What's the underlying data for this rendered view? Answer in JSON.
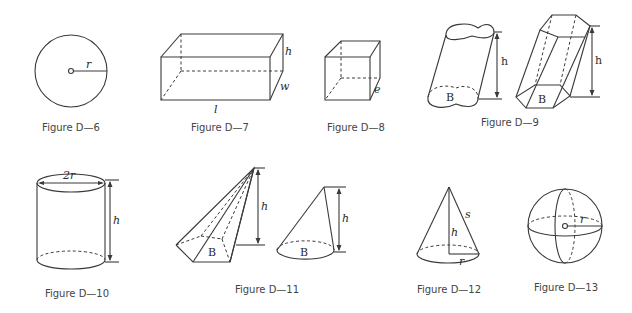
{
  "figures": [
    {
      "id": "D-6",
      "caption": "Figure D—6",
      "shape": "circle",
      "labels": {
        "radius": "r"
      }
    },
    {
      "id": "D-7",
      "caption": "Figure D—7",
      "shape": "rectangular-box",
      "labels": {
        "height": "h",
        "width": "w",
        "length": "l"
      }
    },
    {
      "id": "D-8",
      "caption": "Figure D—8",
      "shape": "cube",
      "labels": {
        "edge": "e"
      }
    },
    {
      "id": "D-9",
      "caption": "Figure D—9",
      "shape": "oblique-cylinder-and-prism",
      "labels": {
        "height_left": "h",
        "base_left": "B",
        "height_right": "h",
        "base_right": "B"
      }
    },
    {
      "id": "D-10",
      "caption": "Figure D—10",
      "shape": "right-circular-cylinder",
      "labels": {
        "diameter": "2r",
        "height": "h"
      }
    },
    {
      "id": "D-11",
      "caption": "Figure D—11",
      "shape": "pyramid-and-cone",
      "labels": {
        "height_left": "h",
        "base_left": "B",
        "height_right": "h",
        "base_right": "B"
      }
    },
    {
      "id": "D-12",
      "caption": "Figure D—12",
      "shape": "right-circular-cone",
      "labels": {
        "slant": "s",
        "height": "h",
        "radius": "r"
      }
    },
    {
      "id": "D-13",
      "caption": "Figure D—13",
      "shape": "sphere",
      "labels": {
        "radius": "r"
      }
    }
  ],
  "colors": {
    "line": "#3a3a3a",
    "text": "#444444",
    "background": "#ffffff"
  }
}
